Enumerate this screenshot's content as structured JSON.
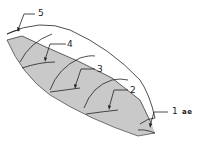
{
  "diagram": {
    "colors": {
      "shade": "#c9c9c9",
      "stroke": "#222222",
      "background": "#ffffff"
    },
    "labels": [
      {
        "id": "1",
        "text": "1"
      },
      {
        "id": "2",
        "text": "2"
      },
      {
        "id": "3",
        "text": "3"
      },
      {
        "id": "4",
        "text": "4"
      },
      {
        "id": "5",
        "text": "5"
      }
    ],
    "extra_text": "ae"
  }
}
